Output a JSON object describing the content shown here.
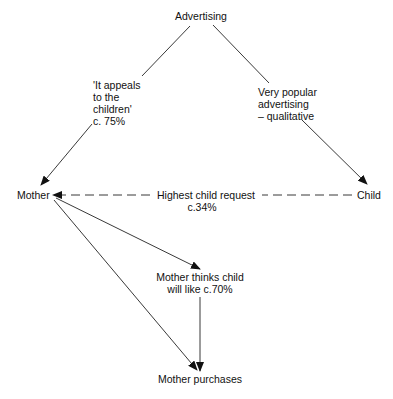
{
  "nodes": {
    "advertising": "Advertising",
    "mother": "Mother",
    "child": "Child",
    "mother_thinks": [
      "Mother thinks child",
      "will like  c.70%"
    ],
    "mother_purchases": "Mother purchases"
  },
  "edge_labels": {
    "appeals": [
      "'It appeals",
      "to the",
      "children'",
      "c. 75%"
    ],
    "popular": [
      "Very popular",
      "advertising",
      "– qualitative"
    ],
    "request": "Highest child request",
    "request_pct": "c.34%"
  },
  "edges": [
    {
      "from": "Advertising",
      "to": "Mother",
      "label": "'It appeals to the children' c. 75%",
      "style": "solid"
    },
    {
      "from": "Advertising",
      "to": "Child",
      "label": "Very popular advertising – qualitative",
      "style": "solid"
    },
    {
      "from": "Child",
      "to": "Mother",
      "label": "Highest child request c.34%",
      "style": "dashed"
    },
    {
      "from": "Mother",
      "to": "Mother thinks child will like",
      "style": "solid"
    },
    {
      "from": "Mother",
      "to": "Mother purchases",
      "style": "solid"
    },
    {
      "from": "Mother thinks child will like",
      "to": "Mother purchases",
      "label": "c.70%",
      "style": "solid"
    }
  ]
}
